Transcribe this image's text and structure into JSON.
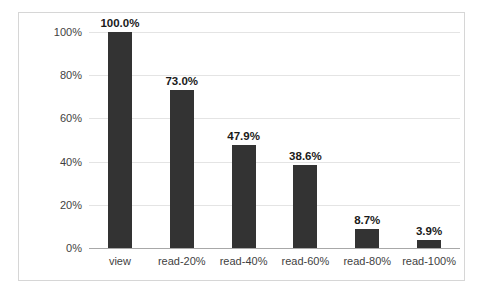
{
  "top_caption_fragment": "— ⌐ ·· ⌐ ·· ⌐ ·· ⌐ ··",
  "chart_data": {
    "type": "bar",
    "title": "",
    "xlabel": "",
    "ylabel": "",
    "categories": [
      "view",
      "read-20%",
      "read-40%",
      "read-60%",
      "read-80%",
      "read-100%"
    ],
    "values": [
      100.0,
      73.0,
      47.9,
      38.6,
      8.7,
      3.9
    ],
    "data_labels": [
      "100.0%",
      "73.0%",
      "47.9%",
      "38.6%",
      "8.7%",
      "3.9%"
    ],
    "ylim": [
      0,
      100
    ],
    "ytick_values": [
      0,
      20,
      40,
      60,
      80,
      100
    ],
    "ytick_labels": [
      "0%",
      "20%",
      "40%",
      "60%",
      "80%",
      "100%"
    ],
    "grid": true,
    "legend": false,
    "legend_position": "none",
    "series_color": "#333333",
    "gridline_color": "#E4E4E4",
    "axis_color": "#A8A8A8",
    "frame_color": "#D6D6D6",
    "background": "#FFFFFF"
  }
}
